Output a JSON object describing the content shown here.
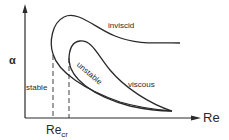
{
  "diagram": {
    "title": "",
    "axes": {
      "y_label": "α",
      "x_label": "Re"
    },
    "regions": {
      "stable": "stable",
      "unstable": "unstable"
    },
    "curves": {
      "inviscid": "inviscid",
      "viscous": "viscous"
    },
    "critical": {
      "base": "Re",
      "subscript": "cr"
    },
    "colors": {
      "line": "#2a2a2a",
      "background": "#ffffff"
    }
  }
}
